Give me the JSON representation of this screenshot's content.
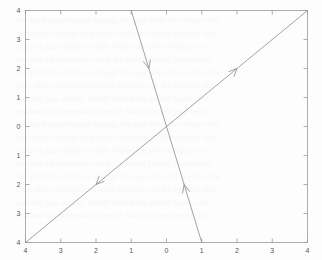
{
  "figure": {
    "background_color": "#fdfdfd",
    "axis_color": "#9a9a9a",
    "line_color": "#8c8c8c",
    "width": 322,
    "height": 260
  },
  "chart_data": {
    "type": "line",
    "title": "",
    "xlabel": "",
    "ylabel": "",
    "xlim": [
      -4,
      4
    ],
    "ylim": [
      -4,
      4
    ],
    "grid": false,
    "legend": "none",
    "xticks": [
      -4,
      -3,
      -2,
      -1,
      0,
      1,
      2,
      3,
      4
    ],
    "yticks": [
      -4,
      -3,
      -2,
      -1,
      0,
      1,
      2,
      3,
      4
    ],
    "xticklabels": [
      "4",
      "3",
      "2",
      "1",
      "0",
      "1",
      "2",
      "3",
      "4"
    ],
    "yticklabels": [
      "4",
      "3",
      "2",
      "1",
      "0",
      "1",
      "2",
      "3",
      "4"
    ],
    "series": [
      {
        "name": "rising-line",
        "equation": "y = x",
        "slope": 1,
        "intercept": 0,
        "x": [
          -4,
          4
        ],
        "y": [
          -4,
          4
        ],
        "arrows": [
          {
            "name": "arrow-northeast",
            "at_x": 2,
            "at_y": 2,
            "direction": "northeast"
          },
          {
            "name": "arrow-southwest",
            "at_x": -2,
            "at_y": -2,
            "direction": "southwest"
          }
        ]
      },
      {
        "name": "falling-line",
        "equation": "y = -4x",
        "slope": -4,
        "intercept": 0,
        "x": [
          -1,
          1
        ],
        "y": [
          4,
          -4
        ],
        "arrows": [
          {
            "name": "arrow-down",
            "at_x": -0.5,
            "at_y": 2,
            "direction": "down"
          },
          {
            "name": "arrow-up",
            "at_x": 0.5,
            "at_y": -2,
            "direction": "up"
          }
        ]
      }
    ]
  },
  "ghost_watermark": {
    "line1": "the text beneath shows through the page from the reverse side",
    "line2": "faint show-through of printed characters on the opposite leaf",
    "line3": "scanned page artifact visible behind the plotted figure area",
    "line4": "residual ink impression from the facing printed page below"
  }
}
